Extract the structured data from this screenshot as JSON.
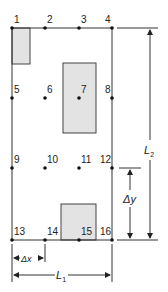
{
  "diagram": {
    "grid": {
      "columns_x": [
        12,
        45,
        79,
        112
      ],
      "rows_y": [
        28,
        98,
        168,
        240
      ],
      "line_color": "#333333",
      "node_color": "#111111"
    },
    "nodes": [
      {
        "id": "1",
        "label": "1",
        "col": 0,
        "row": 0
      },
      {
        "id": "2",
        "label": "2",
        "col": 1,
        "row": 0
      },
      {
        "id": "3",
        "label": "3",
        "col": 2,
        "row": 0
      },
      {
        "id": "4",
        "label": "4",
        "col": 3,
        "row": 0
      },
      {
        "id": "5",
        "label": "5",
        "col": 0,
        "row": 1
      },
      {
        "id": "6",
        "label": "6",
        "col": 1,
        "row": 1
      },
      {
        "id": "7",
        "label": "7",
        "col": 2,
        "row": 1
      },
      {
        "id": "8",
        "label": "8",
        "col": 3,
        "row": 1
      },
      {
        "id": "9",
        "label": "9",
        "col": 0,
        "row": 2
      },
      {
        "id": "10",
        "label": "10",
        "col": 1,
        "row": 2
      },
      {
        "id": "11",
        "label": "11",
        "col": 2,
        "row": 2
      },
      {
        "id": "12",
        "label": "12",
        "col": 3,
        "row": 2
      },
      {
        "id": "13",
        "label": "13",
        "col": 0,
        "row": 3
      },
      {
        "id": "14",
        "label": "14",
        "col": 1,
        "row": 3
      },
      {
        "id": "15",
        "label": "15",
        "col": 2,
        "row": 3
      },
      {
        "id": "16",
        "label": "16",
        "col": 3,
        "row": 3
      }
    ],
    "shaded_regions": [
      {
        "name": "top-left-region",
        "x": 12,
        "y": 28,
        "w": 18,
        "h": 36
      },
      {
        "name": "center-region",
        "x": 63,
        "y": 63,
        "w": 33,
        "h": 70
      },
      {
        "name": "bottom-region",
        "x": 61,
        "y": 204,
        "w": 35,
        "h": 36
      }
    ],
    "shade_color": "#e3e3e3",
    "dimensions": {
      "L2": {
        "label": "L",
        "subscript": "2"
      },
      "delta_y": {
        "label": "Δy"
      },
      "delta_x": {
        "label": "Δx"
      },
      "L1": {
        "label": "L",
        "subscript": "1"
      }
    }
  }
}
